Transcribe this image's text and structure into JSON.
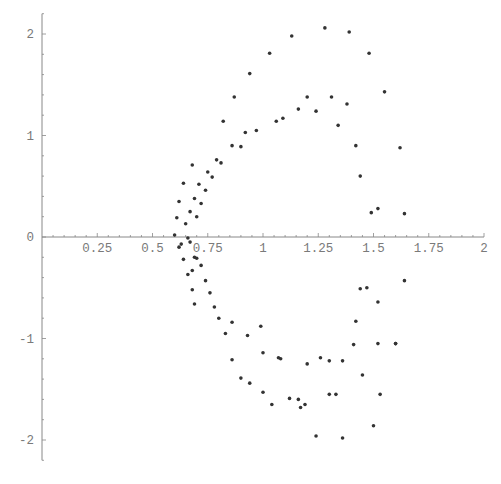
{
  "chart_data": {
    "type": "scatter",
    "title": "",
    "xlabel": "",
    "ylabel": "",
    "xlim": [
      0,
      2
    ],
    "ylim": [
      -2.2,
      2.2
    ],
    "grid": false,
    "legend": null,
    "x_ticks": [
      0.25,
      0.5,
      0.75,
      1,
      1.25,
      1.5,
      1.75,
      2
    ],
    "x_tick_labels": [
      "0.25",
      "0.5",
      "0.75",
      "1",
      "1.25",
      "1.5",
      "1.75",
      "2"
    ],
    "y_ticks": [
      -2,
      -1,
      0,
      1,
      2
    ],
    "y_tick_labels": [
      "-2",
      "-1",
      "0",
      "1",
      "2"
    ],
    "colors": {
      "axis": "#888888",
      "point": "#333333",
      "label": "#7a7a7a"
    },
    "series": [
      {
        "name": "points",
        "x": [
          0.6,
          0.61,
          0.62,
          0.64,
          0.65,
          0.67,
          0.68,
          0.69,
          0.7,
          0.71,
          0.72,
          0.74,
          0.75,
          0.77,
          0.79,
          0.81,
          0.82,
          0.86,
          0.87,
          0.9,
          0.92,
          0.94,
          0.97,
          1.03,
          1.06,
          1.09,
          1.13,
          1.16,
          1.2,
          1.24,
          1.28,
          1.31,
          1.34,
          1.38,
          1.39,
          1.42,
          1.44,
          1.48,
          1.55,
          1.62,
          1.64,
          0.62,
          0.64,
          0.66,
          0.68,
          0.69,
          0.7,
          0.72,
          0.74,
          0.76,
          0.78,
          0.8,
          0.83,
          0.86,
          0.9,
          0.94,
          1.0,
          1.04,
          1.08,
          1.12,
          1.16,
          1.2,
          1.24,
          1.3,
          1.36,
          1.41,
          1.45,
          1.5,
          1.52,
          1.6,
          1.64,
          0.67,
          0.63,
          0.69,
          0.66,
          0.68,
          0.93,
          1.0,
          1.07,
          1.17,
          1.19,
          1.26,
          1.36,
          1.42,
          1.47,
          1.53,
          0.86,
          0.99,
          1.3,
          1.33,
          1.52,
          1.6,
          1.49,
          1.44,
          1.52
        ],
        "y": [
          0.02,
          0.19,
          0.35,
          0.53,
          0.13,
          0.25,
          0.71,
          0.38,
          0.2,
          0.52,
          0.33,
          0.46,
          0.64,
          0.59,
          0.76,
          0.73,
          1.14,
          0.9,
          1.38,
          0.89,
          1.03,
          1.61,
          1.05,
          1.81,
          1.14,
          1.17,
          1.98,
          1.26,
          1.38,
          1.24,
          2.06,
          1.38,
          1.1,
          1.31,
          2.02,
          0.9,
          0.6,
          1.81,
          1.43,
          0.88,
          0.23,
          -0.1,
          -0.22,
          -0.37,
          -0.52,
          -0.66,
          -0.21,
          -0.28,
          -0.43,
          -0.55,
          -0.69,
          -0.8,
          -0.95,
          -1.21,
          -1.39,
          -1.44,
          -1.53,
          -1.65,
          -1.2,
          -1.59,
          -1.6,
          -1.25,
          -1.96,
          -1.22,
          -1.98,
          -1.06,
          -1.36,
          -1.86,
          -0.64,
          -1.05,
          -0.43,
          -0.05,
          -0.07,
          -0.2,
          -0.01,
          -0.33,
          -0.97,
          -1.14,
          -1.19,
          -1.68,
          -1.65,
          -1.19,
          -1.22,
          -0.83,
          -0.5,
          -1.55,
          -0.84,
          -0.88,
          -1.55,
          -1.55,
          -1.05,
          -1.05,
          0.24,
          -0.51,
          0.28
        ]
      }
    ]
  }
}
